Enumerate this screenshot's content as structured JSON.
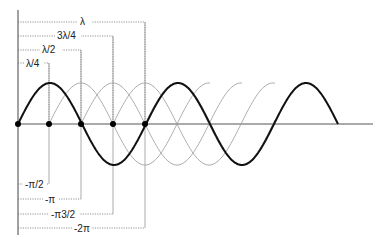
{
  "diagram": {
    "title": "",
    "wavelength_labels": [
      "λ/4",
      "λ/2",
      "3λ/4",
      "λ"
    ],
    "phase_labels": [
      "-π/2",
      "-π",
      "-π3/2",
      "-2π"
    ],
    "colors": {
      "bold_wave": "#111111",
      "thin_wave": "#999999",
      "guide": "#666666",
      "axis": "#555555",
      "dot": "#000000"
    },
    "dot_count": 5
  }
}
